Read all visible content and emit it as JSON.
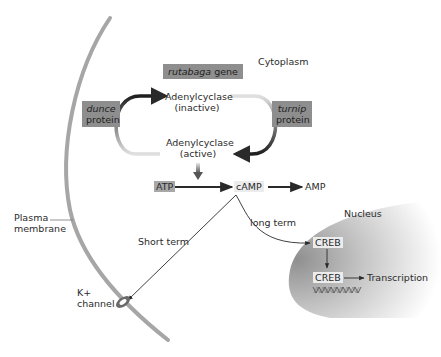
{
  "regions": {
    "cytoplasm": "Cytoplasm",
    "nucleus": "Nucleus",
    "plasma_membrane": [
      "Plasma",
      "membrane"
    ]
  },
  "genes": {
    "rutabaga": {
      "italic": "rutabaga",
      "rest": " gene"
    },
    "dunce": {
      "italic": "dunce",
      "rest": "protein"
    },
    "turnip": {
      "italic": "turnip",
      "rest": "protein"
    }
  },
  "enzyme": {
    "inactive": [
      "Adenylcyclase",
      "(inactive)"
    ],
    "active": [
      "Adenylcyclase",
      "(active)"
    ]
  },
  "molecules": {
    "atp": "ATP",
    "camp": "cAMP",
    "amp": "AMP",
    "creb1": "CREB",
    "creb2": "CREB"
  },
  "pathways": {
    "short_term": "Short term",
    "long_term": "long term",
    "transcription": "Transcription"
  },
  "channel": {
    "ion": "K+",
    "label": "channel"
  },
  "colors": {
    "membrane": "#a6a6a6",
    "gene_box": "#8e8e8e",
    "molecule_box": "#c8c8c8",
    "nucleus_dark": "#9a9a9a",
    "arrow": "#2a2a2a"
  }
}
